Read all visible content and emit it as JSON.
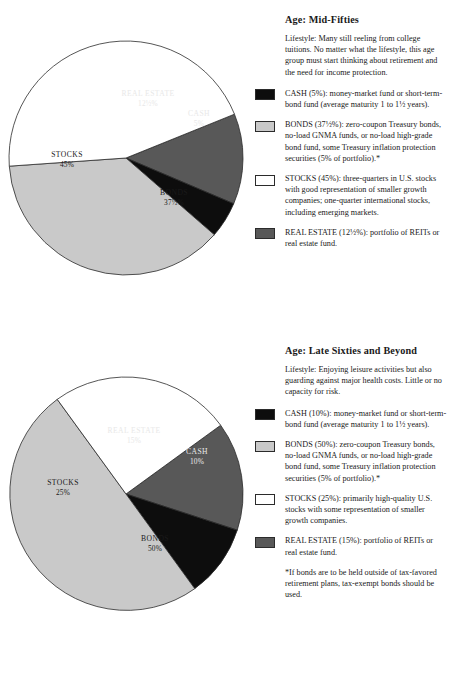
{
  "colors": {
    "cash": "#0d0d0d",
    "bonds": "#c9c9c9",
    "stocks": "#ffffff",
    "real_estate": "#585858",
    "outline": "#2b2b2b",
    "text": "#1a1a1a"
  },
  "sections": [
    {
      "title": "Age: Mid-Fifties",
      "lifestyle": "Lifestyle: Many still reeling from college tuitions. No matter what the lifestyle, this age group must start thinking about retirement and the need for income protection.",
      "legend": [
        {
          "swatch": "cash",
          "text": "CASH (5%): money-market fund or short-term-bond fund (average maturity 1 to 1½ years)."
        },
        {
          "swatch": "bonds",
          "text": "BONDS (37½%): zero-coupon Treasury bonds, no-load GNMA funds, or no-load high-grade bond fund, some Treasury inflation protection securities (5% of portfolio).*"
        },
        {
          "swatch": "stocks",
          "text": "STOCKS (45%): three-quarters in U.S. stocks with good representation of smaller growth companies; one-quarter international stocks, including emerging markets."
        },
        {
          "swatch": "real_estate",
          "text": "REAL ESTATE (12½%): portfolio of REITs or real estate fund."
        }
      ],
      "footnote": ""
    },
    {
      "title": "Age: Late Sixties and Beyond",
      "lifestyle": "Lifestyle: Enjoying leisure activities but also guarding against major health costs. Little or no capacity for risk.",
      "legend": [
        {
          "swatch": "cash",
          "text": "CASH (10%): money-market fund or short-term-bond fund (average maturity 1 to 1½ years)."
        },
        {
          "swatch": "bonds",
          "text": "BONDS (50%): zero-coupon Treasury bonds, no-load GNMA funds, or no-load high-grade bond fund, some Treasury inflation protection securities (5% of portfolio).*"
        },
        {
          "swatch": "stocks",
          "text": "STOCKS (25%): primarily high-quality U.S. stocks with some representation of smaller growth companies."
        },
        {
          "swatch": "real_estate",
          "text": "REAL ESTATE (15%): portfolio of REITs or real estate fund."
        }
      ],
      "footnote": "*If bonds are to be held outside of tax-favored retirement plans, tax-exempt bonds should be used."
    }
  ],
  "chart_data": [
    {
      "type": "pie",
      "title": "Age: Mid-Fifties",
      "labels": [
        "REAL ESTATE",
        "CASH",
        "BONDS",
        "STOCKS"
      ],
      "values": [
        12.5,
        5,
        37.5,
        45
      ],
      "value_labels": [
        "12½%",
        "5%",
        "37½%",
        "45%"
      ],
      "slice_colors": [
        "#585858",
        "#0d0d0d",
        "#c9c9c9",
        "#ffffff"
      ],
      "start_angle_deg": -22,
      "legend": "right"
    },
    {
      "type": "pie",
      "title": "Age: Late Sixties and Beyond",
      "labels": [
        "REAL ESTATE",
        "CASH",
        "BONDS",
        "STOCKS"
      ],
      "values": [
        15,
        10,
        50,
        25
      ],
      "value_labels": [
        "15%",
        "10%",
        "50%",
        "25%"
      ],
      "slice_colors": [
        "#585858",
        "#0d0d0d",
        "#c9c9c9",
        "#ffffff"
      ],
      "start_angle_deg": -36,
      "legend": "right"
    }
  ],
  "pie_text": {
    "p1": {
      "re_name": "REAL ESTATE",
      "re_pct": "12½%",
      "cash_name": "CASH",
      "cash_pct": "5%",
      "bonds_name": "BONDS",
      "bonds_pct": "37½%",
      "stocks_name": "STOCKS",
      "stocks_pct": "45%"
    },
    "p2": {
      "re_name": "REAL ESTATE",
      "re_pct": "15%",
      "cash_name": "CASH",
      "cash_pct": "10%",
      "bonds_name": "BONDS",
      "bonds_pct": "50%",
      "stocks_name": "STOCKS",
      "stocks_pct": "25%"
    }
  }
}
